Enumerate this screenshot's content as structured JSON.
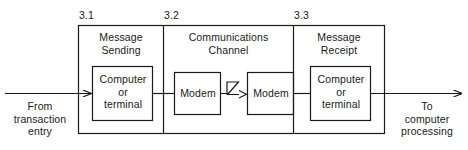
{
  "diagram": {
    "type": "block-flow-diagram",
    "stroke_color": "#1a1a1a",
    "background_color": "#ffffff",
    "steps": [
      {
        "number": "3.1",
        "title": "Message\nSending",
        "node": {
          "label": "Computer\nor\nterminal",
          "shape": "rectangle"
        }
      },
      {
        "number": "3.2",
        "title": "Communications\nChannel",
        "nodes": [
          {
            "label": "Modem",
            "shape": "rectangle"
          },
          {
            "label": "Modem",
            "shape": "rectangle"
          }
        ],
        "internal_connector": {
          "icon": "lightning-zigzag-icon",
          "direction": "left-to-right"
        }
      },
      {
        "number": "3.3",
        "title": "Message\nReceipt",
        "node": {
          "label": "Computer\nor\nterminal",
          "shape": "rectangle"
        }
      }
    ],
    "input": {
      "caption": "From\ntransaction\nentry",
      "arrow_direction": "right"
    },
    "output": {
      "caption": "To\ncomputer\nprocessing",
      "arrow_direction": "right"
    }
  }
}
